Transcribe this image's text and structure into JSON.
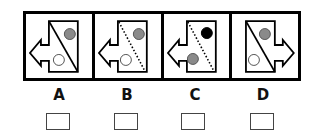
{
  "question": {
    "options": [
      {
        "label": "A",
        "arrow_direction": "left",
        "divider_style": "solid",
        "divider_direction": "top-left-to-bottom-right",
        "upper_circle": {
          "position": "upper-right",
          "fill": "gray"
        },
        "lower_circle": {
          "position": "lower-center",
          "fill": "white"
        }
      },
      {
        "label": "B",
        "arrow_direction": "left",
        "divider_style": "dotted",
        "divider_direction": "top-left-to-bottom-right",
        "upper_circle": {
          "position": "upper-right",
          "fill": "gray"
        },
        "lower_circle": {
          "position": "lower-left",
          "fill": "white"
        }
      },
      {
        "label": "C",
        "arrow_direction": "left",
        "divider_style": "dotted",
        "divider_direction": "top-left-to-bottom-right",
        "upper_circle": {
          "position": "upper-right",
          "fill": "black"
        },
        "lower_circle": {
          "position": "lower-left",
          "fill": "gray"
        }
      },
      {
        "label": "D",
        "arrow_direction": "right",
        "divider_style": "solid",
        "divider_direction": "top-left-to-bottom-right",
        "upper_circle": {
          "position": "upper-right",
          "fill": "gray"
        },
        "lower_circle": {
          "position": "lower-left",
          "fill": "white"
        }
      }
    ],
    "checkboxes": [
      {
        "for": "A",
        "checked": false
      },
      {
        "for": "B",
        "checked": false
      },
      {
        "for": "C",
        "checked": false
      },
      {
        "for": "D",
        "checked": false
      }
    ]
  },
  "colors": {
    "border": "#000000",
    "gray_circle": "#8a8a8a",
    "black_circle": "#000000",
    "white_circle": "#ffffff",
    "checkbox_border": "#444444"
  }
}
